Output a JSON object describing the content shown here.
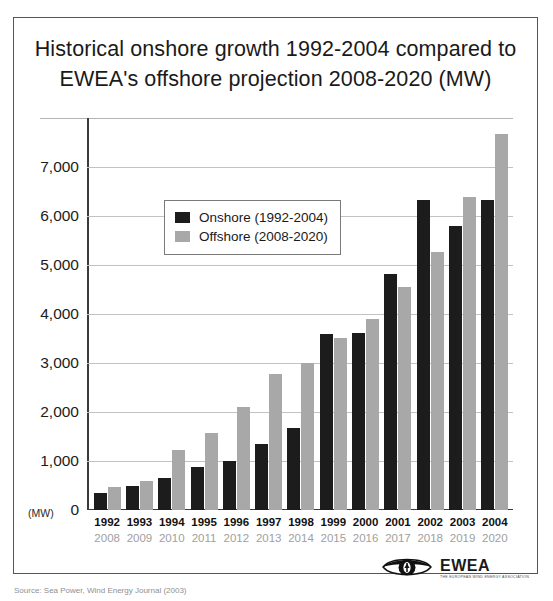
{
  "figure": {
    "title_line1": "Historical onshore growth 1992-2004 compared to",
    "title_line2": "EWEA's offshore projection 2008-2020 (MW)",
    "unit_label": "(MW)",
    "caption": "Source: Sea Power, Wind Energy Journal (2003)"
  },
  "logo": {
    "name": "EWEA",
    "tagline": "THE EUROPEAN WIND ENERGY ASSOCIATION",
    "eye_icon": "eye-icon"
  },
  "colors": {
    "onshore": "#1c1c1c",
    "offshore": "#a8a8a8",
    "gridline": "#c2c2c2",
    "axis": "#3a3a3a",
    "frame": "#555555"
  },
  "chart_data": {
    "type": "bar",
    "title": "Historical onshore growth 1992-2004 compared to EWEA's offshore projection 2008-2020 (MW)",
    "xlabel": "",
    "ylabel": "(MW)",
    "ylim": [
      0,
      8000
    ],
    "yticks": [
      0,
      1000,
      2000,
      3000,
      4000,
      5000,
      6000,
      7000
    ],
    "ytick_labels": [
      "0",
      "1,000",
      "2,000",
      "3,000",
      "4,000",
      "5,000",
      "6,000",
      "7,000"
    ],
    "grid": true,
    "legend_position": "upper-left-inside",
    "categories": [
      "1992",
      "1993",
      "1994",
      "1995",
      "1996",
      "1997",
      "1998",
      "1999",
      "2000",
      "2001",
      "2002",
      "2003",
      "2004"
    ],
    "secondary_categories": [
      "2008",
      "2009",
      "2010",
      "2011",
      "2012",
      "2013",
      "2014",
      "2015",
      "2016",
      "2017",
      "2018",
      "2019",
      "2020"
    ],
    "series": [
      {
        "name": "Onshore (1992-2004)",
        "color": "#1c1c1c",
        "values": [
          350,
          500,
          650,
          880,
          1000,
          1350,
          1680,
          3600,
          3620,
          4820,
          6320,
          5800,
          6330
        ]
      },
      {
        "name": "Offshore (2008-2020)",
        "color": "#a8a8a8",
        "values": [
          470,
          600,
          1230,
          1580,
          2100,
          2770,
          3000,
          3520,
          3900,
          4560,
          5270,
          6380,
          7680
        ]
      }
    ]
  }
}
